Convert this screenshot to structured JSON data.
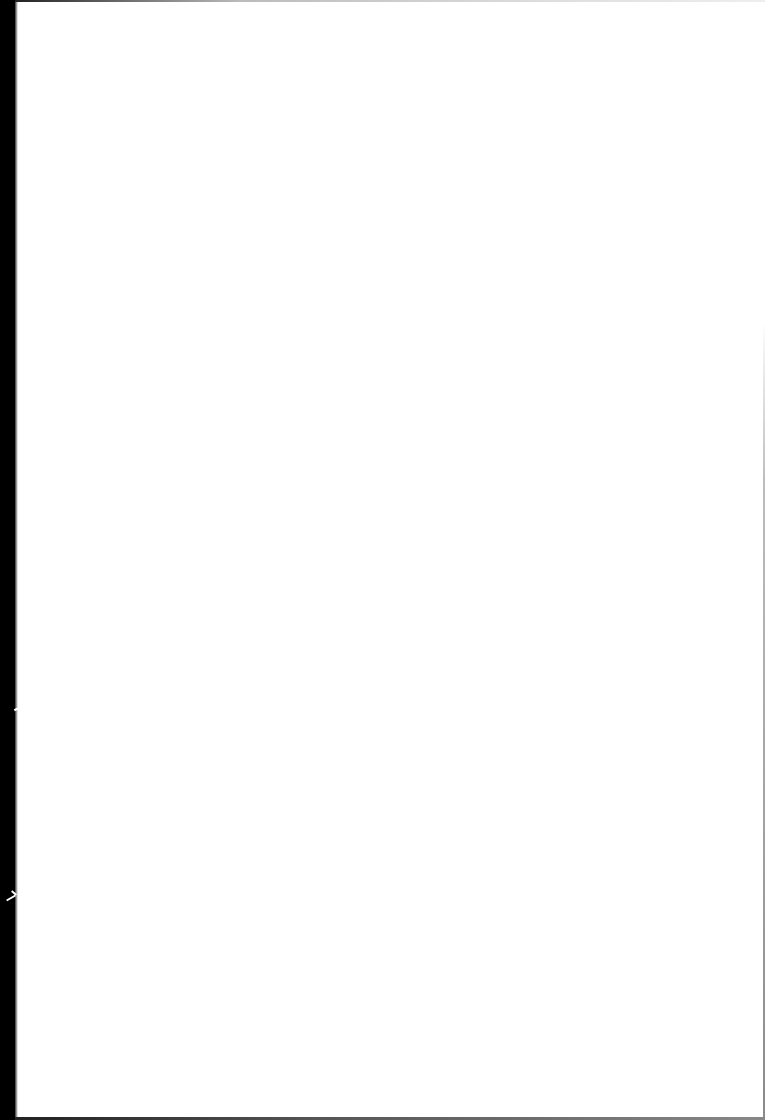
{
  "page": {
    "type": "blank-scanned-page",
    "text_content": "",
    "background_color": "#ffffff"
  },
  "artifacts": {
    "binding_strip": {
      "side": "left",
      "color": "#000000",
      "width_px": 15
    },
    "edges": {
      "top_color": "#bbbbbb",
      "right_color": "#8a8a8a",
      "bottom_color": "#555555"
    }
  }
}
